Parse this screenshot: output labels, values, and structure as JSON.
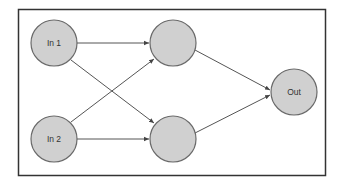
{
  "diagram": {
    "type": "neural-network",
    "nodes": [
      {
        "id": "in1",
        "label": "In 1",
        "x": 54,
        "y": 43
      },
      {
        "id": "in2",
        "label": "In 2",
        "x": 54,
        "y": 139
      },
      {
        "id": "h1",
        "label": "",
        "x": 173,
        "y": 43
      },
      {
        "id": "h2",
        "label": "",
        "x": 173,
        "y": 139
      },
      {
        "id": "out",
        "label": "Out",
        "x": 294,
        "y": 92
      }
    ],
    "edges": [
      {
        "from": "in1",
        "to": "h1"
      },
      {
        "from": "in1",
        "to": "h2"
      },
      {
        "from": "in2",
        "to": "h1"
      },
      {
        "from": "in2",
        "to": "h2"
      },
      {
        "from": "h1",
        "to": "out"
      },
      {
        "from": "h2",
        "to": "out"
      }
    ],
    "colors": {
      "node_fill": "#d0d0d0",
      "node_stroke": "#6a6a6a",
      "edge": "#555555",
      "frame": "#333333"
    }
  }
}
